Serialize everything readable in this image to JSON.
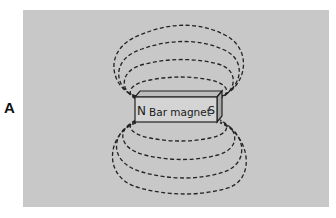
{
  "figure": {
    "panel_label": "A",
    "background_color": "#c8c8c8",
    "magnet": {
      "north_label": "N",
      "name_label": "Bar magnet",
      "south_label": "S",
      "face_color": "#d4d4d4"
    },
    "field_lines": {
      "style": "dashed",
      "upper_loops": 4,
      "lower_loops": 4,
      "color": "#222222"
    }
  }
}
